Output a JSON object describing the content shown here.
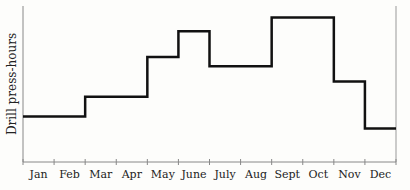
{
  "chart_data": {
    "type": "line",
    "style": "step",
    "title": "",
    "xlabel": "",
    "ylabel": "Drill press-hours",
    "categories": [
      "Jan",
      "Feb",
      "Mar",
      "Apr",
      "May",
      "June",
      "July",
      "Aug",
      "Sept",
      "Oct",
      "Nov",
      "Dec"
    ],
    "values": [
      30,
      30,
      43,
      43,
      69,
      86,
      63,
      63,
      95,
      95,
      53,
      22
    ],
    "ylim": [
      0,
      100
    ],
    "y_ticks_labeled": false,
    "grid": false,
    "legend": null,
    "line_color": "#111111"
  }
}
